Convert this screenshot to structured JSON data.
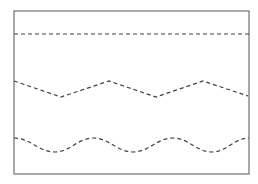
{
  "diagram": {
    "frame": {
      "x": 14,
      "y": 11,
      "width": 235,
      "height": 163,
      "stroke": "#707070",
      "stroke_width": 1.2
    },
    "line_color": "#404040",
    "dash_pattern": "4 3",
    "lines": [
      {
        "name": "straight-dashed-line",
        "type": "straight",
        "points": [
          [
            14,
            34
          ],
          [
            249,
            34
          ]
        ]
      },
      {
        "name": "zigzag-dashed-line",
        "type": "zigzag",
        "points": [
          [
            14,
            81
          ],
          [
            61,
            97
          ],
          [
            109,
            81
          ],
          [
            156,
            97
          ],
          [
            203,
            81
          ],
          [
            248,
            96
          ]
        ]
      },
      {
        "name": "wavy-dashed-line",
        "type": "wave",
        "center_y": 145,
        "amplitude": 7,
        "x_start": 14,
        "x_end": 249,
        "extrema": [
          [
            14,
            138
          ],
          [
            55,
            152
          ],
          [
            93,
            138
          ],
          [
            133,
            152
          ],
          [
            173,
            138
          ],
          [
            212,
            152
          ],
          [
            249,
            138
          ]
        ]
      }
    ]
  }
}
